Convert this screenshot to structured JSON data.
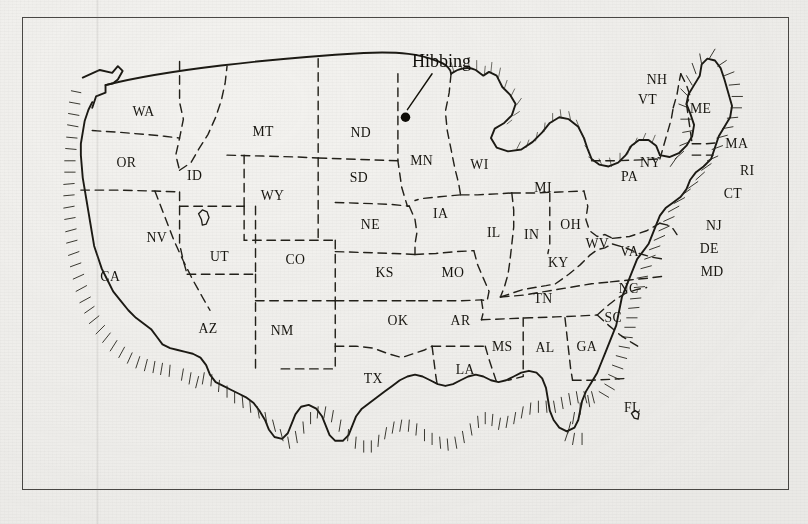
{
  "figure": {
    "kind": "engraved-line-map",
    "caption_clipped": "The caption line is cropped at the bottom edge of the page.",
    "paper_color": "#f3f2ef",
    "ink_color": "#17150f",
    "frame_color": "#4a4845"
  },
  "annotation": {
    "city_label": "Hibbing",
    "city_state": "MN",
    "marker": "filled-dot",
    "leader": "line from label down-left to dot"
  },
  "states": [
    {
      "abbr": "WA",
      "x": 128,
      "y": 101
    },
    {
      "abbr": "OR",
      "x": 110,
      "y": 155
    },
    {
      "abbr": "CA",
      "x": 93,
      "y": 276
    },
    {
      "abbr": "NV",
      "x": 142,
      "y": 235
    },
    {
      "abbr": "ID",
      "x": 182,
      "y": 169
    },
    {
      "abbr": "MT",
      "x": 254,
      "y": 123
    },
    {
      "abbr": "WY",
      "x": 264,
      "y": 190
    },
    {
      "abbr": "UT",
      "x": 208,
      "y": 255
    },
    {
      "abbr": "AZ",
      "x": 196,
      "y": 331
    },
    {
      "abbr": "CO",
      "x": 288,
      "y": 258
    },
    {
      "abbr": "NM",
      "x": 274,
      "y": 333
    },
    {
      "abbr": "ND",
      "x": 357,
      "y": 124
    },
    {
      "abbr": "SD",
      "x": 355,
      "y": 171
    },
    {
      "abbr": "NE",
      "x": 367,
      "y": 221
    },
    {
      "abbr": "KS",
      "x": 382,
      "y": 272
    },
    {
      "abbr": "OK",
      "x": 396,
      "y": 322
    },
    {
      "abbr": "TX",
      "x": 370,
      "y": 384
    },
    {
      "abbr": "MN",
      "x": 421,
      "y": 153
    },
    {
      "abbr": "IA",
      "x": 441,
      "y": 209
    },
    {
      "abbr": "MO",
      "x": 454,
      "y": 272
    },
    {
      "abbr": "AR",
      "x": 462,
      "y": 322
    },
    {
      "abbr": "LA",
      "x": 467,
      "y": 374
    },
    {
      "abbr": "WI",
      "x": 482,
      "y": 157
    },
    {
      "abbr": "IL",
      "x": 497,
      "y": 229
    },
    {
      "abbr": "MS",
      "x": 506,
      "y": 350
    },
    {
      "abbr": "MI",
      "x": 549,
      "y": 182
    },
    {
      "abbr": "IN",
      "x": 537,
      "y": 231
    },
    {
      "abbr": "KY",
      "x": 565,
      "y": 261
    },
    {
      "abbr": "TN",
      "x": 549,
      "y": 299
    },
    {
      "abbr": "AL",
      "x": 551,
      "y": 351
    },
    {
      "abbr": "OH",
      "x": 578,
      "y": 221
    },
    {
      "abbr": "WV",
      "x": 606,
      "y": 241
    },
    {
      "abbr": "VA",
      "x": 640,
      "y": 249
    },
    {
      "abbr": "GA",
      "x": 595,
      "y": 350
    },
    {
      "abbr": "SC",
      "x": 623,
      "y": 319
    },
    {
      "abbr": "NC",
      "x": 639,
      "y": 288
    },
    {
      "abbr": "FL",
      "x": 643,
      "y": 414
    },
    {
      "abbr": "PA",
      "x": 640,
      "y": 170
    },
    {
      "abbr": "NY",
      "x": 662,
      "y": 155
    },
    {
      "abbr": "VT",
      "x": 659,
      "y": 89
    },
    {
      "abbr": "NH",
      "x": 669,
      "y": 68
    },
    {
      "abbr": "ME",
      "x": 715,
      "y": 98
    },
    {
      "abbr": "MA",
      "x": 753,
      "y": 135
    },
    {
      "abbr": "RI",
      "x": 764,
      "y": 164
    },
    {
      "abbr": "CT",
      "x": 749,
      "y": 188
    },
    {
      "abbr": "NJ",
      "x": 729,
      "y": 222
    },
    {
      "abbr": "DE",
      "x": 724,
      "y": 246
    },
    {
      "abbr": "MD",
      "x": 727,
      "y": 270
    }
  ]
}
